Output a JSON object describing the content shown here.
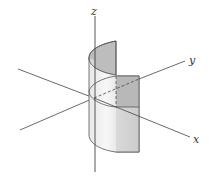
{
  "figure": {
    "axes": {
      "z": {
        "label": "z"
      },
      "y": {
        "label": "y"
      },
      "x": {
        "label": "x"
      }
    },
    "colors": {
      "axis": "#444444",
      "outline": "#555555",
      "surface_dark": "#bdbdbd",
      "surface_light": "#f2f2f2",
      "surface_mid": "#d4d4d4"
    }
  }
}
